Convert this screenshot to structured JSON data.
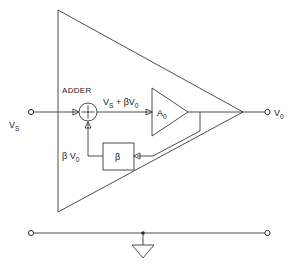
{
  "diagram": {
    "type": "circuit-block-diagram",
    "colors": {
      "line": "#2b2b2b",
      "text": "#1a1a1a",
      "background": "#ffffff"
    },
    "labels": {
      "source_main": "V",
      "source_sub": "S",
      "output_main": "V",
      "output_sub": "0",
      "adder": "ADDER",
      "adder_sign": "+",
      "sum_node_expr_a": "V",
      "sum_node_expr_a_sub": "S",
      "sum_node_expr_plus": "+",
      "sum_node_expr_b": "βV",
      "sum_node_expr_b_sub": "0",
      "amp_gain_main": "A",
      "amp_gain_sub": "0",
      "beta_block": "β",
      "feedback_main": "β V",
      "feedback_sub": "0"
    },
    "elements": [
      {
        "name": "outer-amplifier-triangle",
        "kind": "triangle"
      },
      {
        "name": "input-terminal",
        "kind": "terminal"
      },
      {
        "name": "output-terminal",
        "kind": "terminal"
      },
      {
        "name": "summing-junction",
        "kind": "circle-adder"
      },
      {
        "name": "internal-amplifier",
        "kind": "triangle-gain"
      },
      {
        "name": "beta-feedback-block",
        "kind": "rect"
      },
      {
        "name": "ground-terminal-left",
        "kind": "terminal"
      },
      {
        "name": "ground-terminal-right",
        "kind": "terminal"
      },
      {
        "name": "ground-symbol",
        "kind": "ground"
      }
    ]
  }
}
